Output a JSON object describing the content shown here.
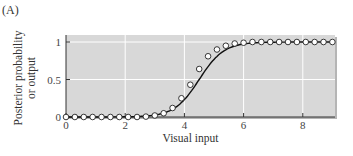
{
  "panel_label": "(A)",
  "colors": {
    "plot_background": "#d8d8d8",
    "gridline": "#ffffff",
    "curve": "#111111",
    "marker_fill": "#ffffff",
    "marker_stroke": "#222222"
  },
  "chart_data": {
    "type": "line",
    "title": "",
    "xlabel": "Visual input",
    "ylabel": "Posterior probability\nor output",
    "ylabel_lines": [
      "Posterior probability",
      "or output"
    ],
    "xlim": [
      0,
      9
    ],
    "ylim": [
      0,
      1.1
    ],
    "xticks": [
      0,
      2,
      4,
      6,
      8
    ],
    "xtick_labels": [
      "0",
      "2",
      "4",
      "6",
      "8"
    ],
    "yticks": [
      0,
      0.5,
      1
    ],
    "ytick_labels": [
      "0",
      "0.5",
      "1"
    ],
    "grid": true,
    "legend": null,
    "series": [
      {
        "name": "Posterior probability (markers)",
        "style": "open-circles",
        "x": [
          0,
          0.3,
          0.6,
          0.9,
          1.2,
          1.5,
          1.8,
          2.1,
          2.4,
          2.7,
          3.0,
          3.3,
          3.6,
          3.9,
          4.2,
          4.5,
          4.8,
          5.1,
          5.4,
          5.7,
          6.0,
          6.3,
          6.6,
          6.9,
          7.2,
          7.5,
          7.8,
          8.1,
          8.4,
          8.7,
          9.0
        ],
        "y": [
          0,
          0,
          0,
          0,
          0,
          0,
          0,
          0,
          0,
          0.005,
          0.02,
          0.05,
          0.12,
          0.25,
          0.43,
          0.64,
          0.81,
          0.9,
          0.95,
          0.98,
          0.99,
          1,
          1,
          1,
          1,
          1,
          1,
          1,
          1,
          1,
          1
        ]
      },
      {
        "name": "Output (curve)",
        "style": "solid-line",
        "sigmoid": {
          "center": 4.5,
          "slope": 2.4
        }
      }
    ]
  }
}
